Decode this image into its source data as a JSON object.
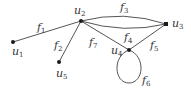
{
  "diagram": {
    "type": "graph",
    "vertices": [
      {
        "id": "u1",
        "name": "u",
        "sub": "1",
        "x": 13,
        "y": 42,
        "lx": 12,
        "ly": 55
      },
      {
        "id": "u2",
        "name": "u",
        "sub": "2",
        "x": 81,
        "y": 21,
        "lx": 74,
        "ly": 14
      },
      {
        "id": "u3",
        "name": "u",
        "sub": "3",
        "x": 166,
        "y": 24,
        "lx": 172,
        "ly": 27
      },
      {
        "id": "u4",
        "name": "u",
        "sub": "4",
        "x": 129,
        "y": 50,
        "lx": 111,
        "ly": 54
      },
      {
        "id": "u5",
        "name": "u",
        "sub": "5",
        "x": 59,
        "y": 62,
        "lx": 56,
        "ly": 77
      }
    ],
    "edges": [
      {
        "id": "f1",
        "name": "f",
        "sub": "1",
        "from": "u1",
        "to": "u2",
        "lx": 37,
        "ly": 31
      },
      {
        "id": "f2",
        "name": "f",
        "sub": "2",
        "from": "u2",
        "to": "u5",
        "lx": 54,
        "ly": 49
      },
      {
        "id": "f3",
        "name": "f",
        "sub": "3",
        "from": "u2",
        "to": "u3",
        "curve": "upper",
        "lx": 120,
        "ly": 11
      },
      {
        "id": "f4",
        "name": "f",
        "sub": "4",
        "from": "u2",
        "to": "u3",
        "curve": "lower",
        "lx": 124,
        "ly": 41
      },
      {
        "id": "f5",
        "name": "f",
        "sub": "5",
        "from": "u3",
        "to": "u4",
        "lx": 150,
        "ly": 49
      },
      {
        "id": "f6",
        "name": "f",
        "sub": "6",
        "from": "u4",
        "to": "u4",
        "loop": true,
        "lx": 142,
        "ly": 84
      },
      {
        "id": "f7",
        "name": "f",
        "sub": "7",
        "from": "u2",
        "to": "u4",
        "lx": 89,
        "ly": 46
      }
    ]
  }
}
